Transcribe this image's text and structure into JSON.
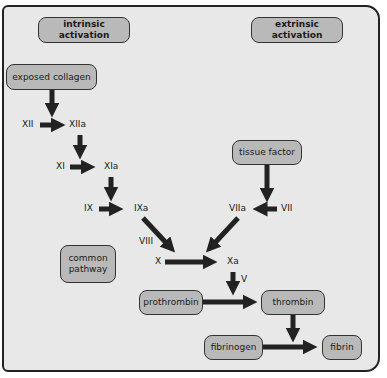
{
  "headers": {
    "intrinsic": "intrinsic activation",
    "extrinsic": "extrinsic activation"
  },
  "boxes": {
    "exposed_collagen": "exposed collagen",
    "tissue_factor": "tissue factor",
    "common_pathway": "common pathway",
    "prothrombin": "prothrombin",
    "thrombin": "thrombin",
    "fibrinogen": "fibrinogen",
    "fibrin": "fibrin"
  },
  "factors": {
    "XII": "XII",
    "XIIa": "XIIa",
    "XI": "XI",
    "XIa": "XIa",
    "IX": "IX",
    "IXa": "IXa",
    "VIII": "VIII",
    "VII": "VII",
    "VIIa": "VIIa",
    "X": "X",
    "Xa": "Xa",
    "V": "V"
  }
}
